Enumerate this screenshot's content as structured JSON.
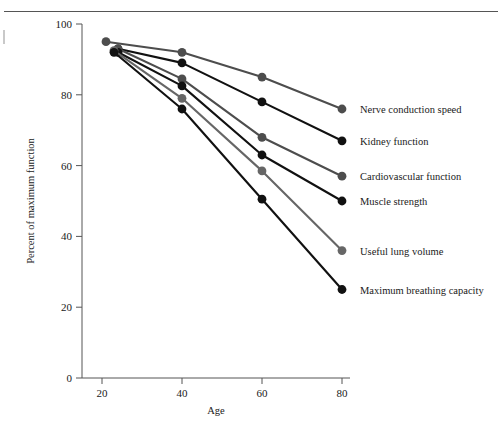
{
  "figure": {
    "background": "#ffffff",
    "has_top_rule": true,
    "left_page_mark": true
  },
  "chart_data": {
    "type": "line",
    "title": "",
    "xlabel": "Age",
    "ylabel": "Percent of maximum function",
    "x": [
      20,
      40,
      60,
      80
    ],
    "xlim": [
      15,
      82
    ],
    "ylim": [
      0,
      100
    ],
    "xticks": [
      20,
      40,
      60,
      80
    ],
    "xtick_labels": [
      "20",
      "40",
      "60",
      "80"
    ],
    "yticks": [
      0,
      20,
      40,
      60,
      80,
      100
    ],
    "ytick_labels": [
      "0",
      "20",
      "40",
      "60",
      "80",
      "100"
    ],
    "grid": false,
    "legend_position": "right-inline-labels",
    "marker": "circle",
    "series": [
      {
        "name": "Nerve conduction speed",
        "color": "#4d4d4d",
        "x": [
          21,
          40,
          60,
          80
        ],
        "values": [
          95,
          92,
          85,
          76
        ],
        "label_y": 76
      },
      {
        "name": "Kidney function",
        "color": "#111111",
        "x": [
          24,
          40,
          60,
          80
        ],
        "values": [
          93,
          89,
          78,
          67
        ],
        "label_y": 67
      },
      {
        "name": "Cardiovascular function",
        "color": "#4d4d4d",
        "x": [
          24,
          40,
          60,
          80
        ],
        "values": [
          93,
          84.5,
          68,
          57
        ],
        "label_y": 57
      },
      {
        "name": "Muscle strength",
        "color": "#111111",
        "x": [
          24,
          40,
          60,
          80
        ],
        "values": [
          92,
          82.5,
          63,
          50
        ],
        "label_y": 50
      },
      {
        "name": "Useful lung volume",
        "color": "#666666",
        "x": [
          23,
          40,
          60,
          80
        ],
        "values": [
          92.5,
          79,
          58.5,
          36
        ],
        "label_y": 36
      },
      {
        "name": "Maximum breathing capacity",
        "color": "#111111",
        "x": [
          23,
          40,
          60,
          80
        ],
        "values": [
          92,
          76,
          50.5,
          25
        ],
        "label_y": 25
      }
    ]
  }
}
